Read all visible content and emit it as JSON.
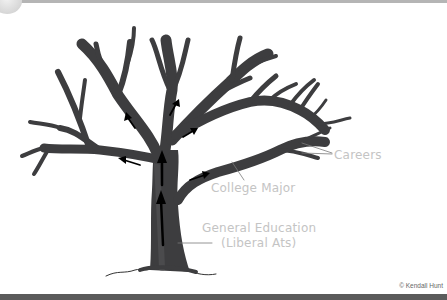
{
  "diagram": {
    "labels": {
      "careers": "Careers",
      "college_major": "College Major",
      "general_education_line1": "General Education",
      "general_education_line2": "(Liberal Ats)"
    },
    "credit": "© Kendall Hunt",
    "colors": {
      "tree_fill": "#3d3d3f",
      "tree_highlight": "#5a5a5c",
      "arrow": "#000000",
      "label_text": "#c4c4c4",
      "leader_line": "#7a7a7a",
      "bottom_bar": "#5b5b5b"
    },
    "icons": {
      "growth_arrows": "arrow-up-icon"
    }
  }
}
